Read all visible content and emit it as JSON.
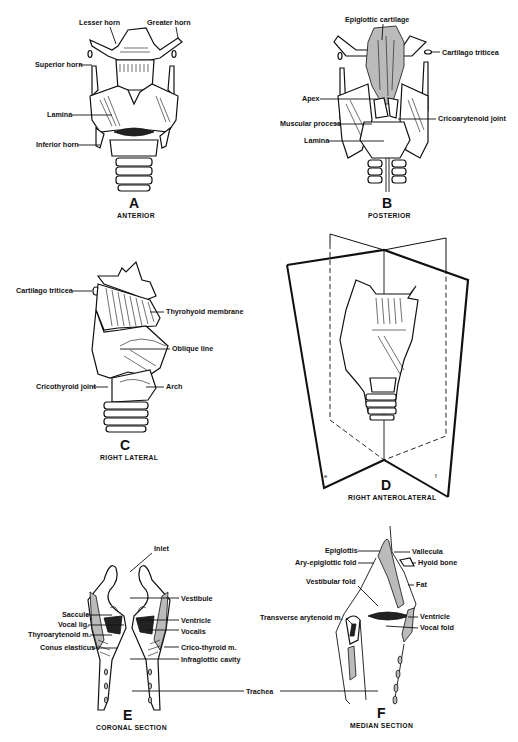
{
  "figure": {
    "panels": [
      {
        "id": "A",
        "letter": "A",
        "caption": "ANTERIOR",
        "labels": [
          "Lesser horn",
          "Greater horn",
          "Superior horn",
          "Lamina",
          "Inferior horn"
        ]
      },
      {
        "id": "B",
        "letter": "B",
        "caption": "POSTERIOR",
        "labels": [
          "Epiglottic cartilage",
          "Cartilago triticea",
          "Apex",
          "Muscular process",
          "Cricoarytenoid joint",
          "Lamina"
        ]
      },
      {
        "id": "C",
        "letter": "C",
        "caption": "RIGHT LATERAL",
        "labels": [
          "Cartilago triticea",
          "Thyrohyoid membrane",
          "Oblique line",
          "Cricothyroid joint",
          "Arch"
        ]
      },
      {
        "id": "D",
        "letter": "D",
        "caption": "RIGHT ANTEROLATERAL",
        "plane_labels": [
          "e",
          "f"
        ]
      },
      {
        "id": "E",
        "letter": "E",
        "caption": "CORONAL SECTION",
        "labels": [
          "Inlet",
          "Vestibule",
          "Saccule",
          "Vocal lig.",
          "Thyroarytenoid m.",
          "Conus elasticus",
          "Ventricle",
          "Vocalis",
          "Crico-thyroid m.",
          "Infraglottic cavity",
          "Trachea"
        ]
      },
      {
        "id": "F",
        "letter": "F",
        "caption": "MEDIAN SECTION",
        "labels": [
          "Epiglottis",
          "Ary-epiglottic fold",
          "Vestibular fold",
          "Vallecula",
          "Hyoid bone",
          "Fat",
          "Transverse arytenoid m.",
          "Ventricle",
          "Vocal fold"
        ]
      }
    ]
  }
}
